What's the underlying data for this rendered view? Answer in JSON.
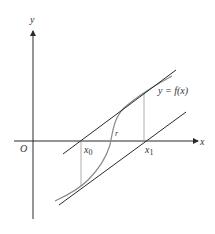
{
  "diagram": {
    "type": "newton-method-illustration",
    "colors": {
      "axis": "#2a2a2a",
      "tangent": "#2a2a2a",
      "curve": "#8a8a8a",
      "guide": "#9a9a9a",
      "text": "#333333"
    },
    "labels": {
      "y_axis": "y",
      "x_axis": "x",
      "origin": "O",
      "curve": "y = f(x)",
      "root": "r",
      "x0": "x",
      "x0_sub": "0",
      "x1": "x",
      "x1_sub": "1"
    }
  }
}
